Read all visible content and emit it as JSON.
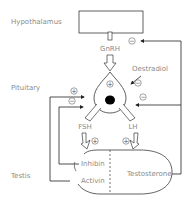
{
  "diagram": {
    "regions": {
      "hypothalamus": "Hypothalamus",
      "pituitary": "Pituitary",
      "testis": "Testis"
    },
    "hormones": {
      "gnrh": "GnRH",
      "oestradiol": "Oestradiol",
      "fsh": "FSH",
      "lh": "LH",
      "inhibin": "Inhibin",
      "activin": "Activin",
      "testosterone": "Testosterone"
    },
    "signs": {
      "plus": "+",
      "minus": "−"
    },
    "colors": {
      "line": "#3a3a3a",
      "label": "#8a8a8a",
      "nucleus": "#000000"
    }
  }
}
